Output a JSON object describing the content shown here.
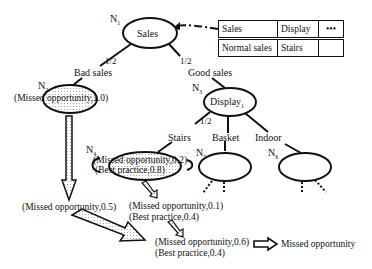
{
  "nodes": {
    "n1": {
      "id": "N",
      "sub": "1",
      "label": "Sales"
    },
    "n2": {
      "id": "N",
      "sub": "2",
      "label": "(Missed opportunity,1.0)"
    },
    "n3": {
      "id": "N",
      "sub": "3",
      "label": "Display",
      "label_sub": "1"
    },
    "n4": {
      "id": "N",
      "sub": "4",
      "line1": "(Missed opportunity,0.2)",
      "line2": "(Best practice,0.8)"
    },
    "n5": {
      "id": "N",
      "sub": "5"
    },
    "n6": {
      "id": "N",
      "sub": "6"
    }
  },
  "edges": {
    "bad_sales": "Bad sales",
    "good_sales": "Good sales",
    "prob_left": "1/2",
    "prob_right": "1/2",
    "stairs": "Stairs",
    "stairs_prob": "1/2",
    "basket": "Basket",
    "indoor": "Indoor"
  },
  "table": {
    "rows": [
      [
        "Sales",
        "Display",
        "•••"
      ],
      [
        "Normal sales",
        "Stairs",
        ""
      ]
    ]
  },
  "results": {
    "left": "(Missed opportunity,0.5)",
    "mid_line1": "(Missed opportunity,0.1)",
    "mid_line2": "(Best practice,0.4)",
    "final_line1": "(Missed opportunity,0.6)",
    "final_line2": "(Best practice,0.4)"
  },
  "legend": {
    "arrow_label": "Missed opportunity"
  }
}
